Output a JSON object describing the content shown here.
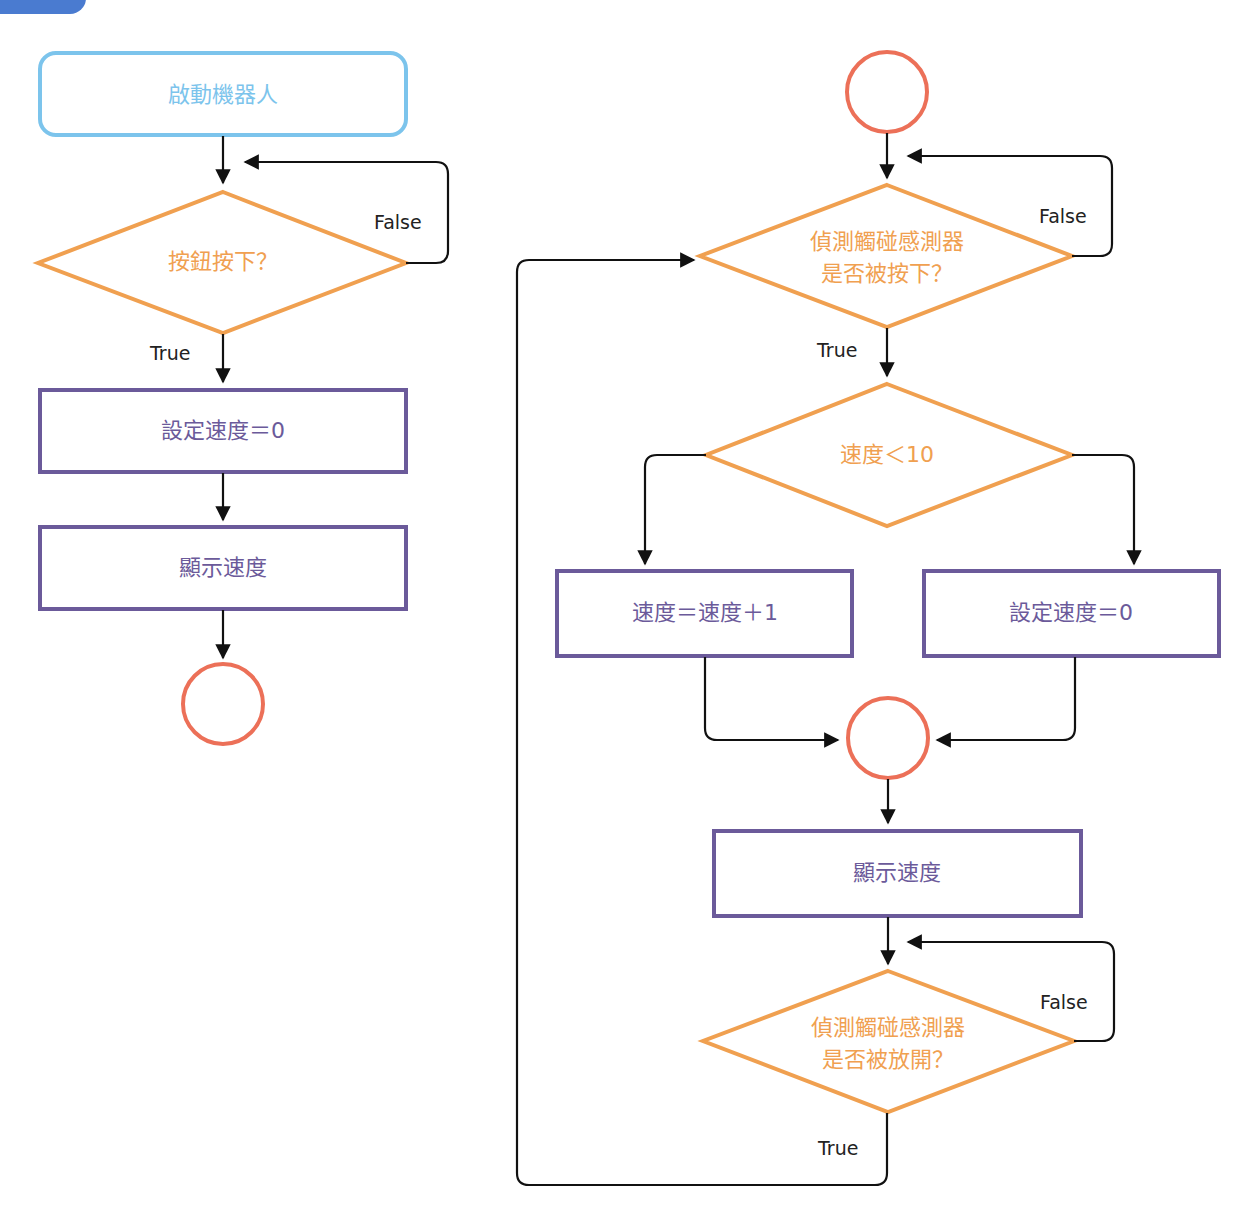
{
  "colors": {
    "start_box": "#7cc4ec",
    "decision": "#f0a050",
    "process": "#6b5a9a",
    "connector": "#ec7058",
    "arrow": "#111111",
    "badge": "#4a7bd0"
  },
  "left_flow": {
    "start": "啟動機器人",
    "decision": "按鈕按下？",
    "false_label": "False",
    "true_label": "True",
    "process_1": "設定速度＝0",
    "process_2": "顯示速度"
  },
  "right_flow": {
    "decision_1_line1": "偵測觸碰感測器",
    "decision_1_line2": "是否被按下？",
    "decision_1_false": "False",
    "decision_1_true": "True",
    "decision_2": "速度＜10",
    "process_left": "速度＝速度＋1",
    "process_right": "設定速度＝0",
    "process_display": "顯示速度",
    "decision_3_line1": "偵測觸碰感測器",
    "decision_3_line2": "是否被放開？",
    "decision_3_false": "False",
    "decision_3_true": "True"
  }
}
